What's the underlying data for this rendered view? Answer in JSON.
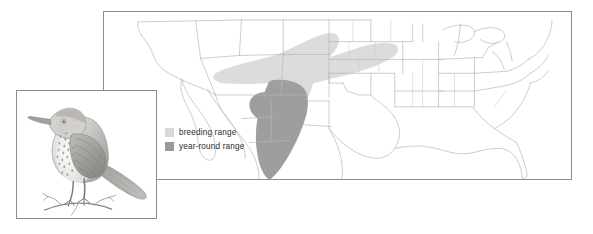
{
  "figure": {
    "background_color": "#ffffff"
  },
  "map_panel": {
    "name": "north-america-range-map",
    "border_color": "#8d8d91",
    "fill_color": "#ffffff",
    "boundary_color": "#b9b9bd",
    "coastline_color": "#a9a9ae"
  },
  "ranges": {
    "breeding": {
      "label": "breeding range",
      "color": "#d8d8d8",
      "region_description": "southwestern United States: southeastern Arizona, New Mexico, western Texas, southeastern Colorado, western Oklahoma and Kansas"
    },
    "year_round": {
      "label": "year-round range",
      "color": "#9a9a9a",
      "region_description": "southern New Mexico and western Texas south through Chihuahua and Sonora into central Mexico"
    }
  },
  "legend": {
    "name": "range-legend",
    "items": [
      {
        "swatch_color": "#d8d8d8",
        "label": "breeding range"
      },
      {
        "swatch_color": "#9a9a9a",
        "label": "year-round range"
      }
    ]
  },
  "bird_panel": {
    "name": "bird-illustration-panel",
    "border_color": "#8d8d91",
    "subject": "thrasher perched on branch",
    "medium": "pencil illustration",
    "ink_color": "#7c7c80"
  }
}
